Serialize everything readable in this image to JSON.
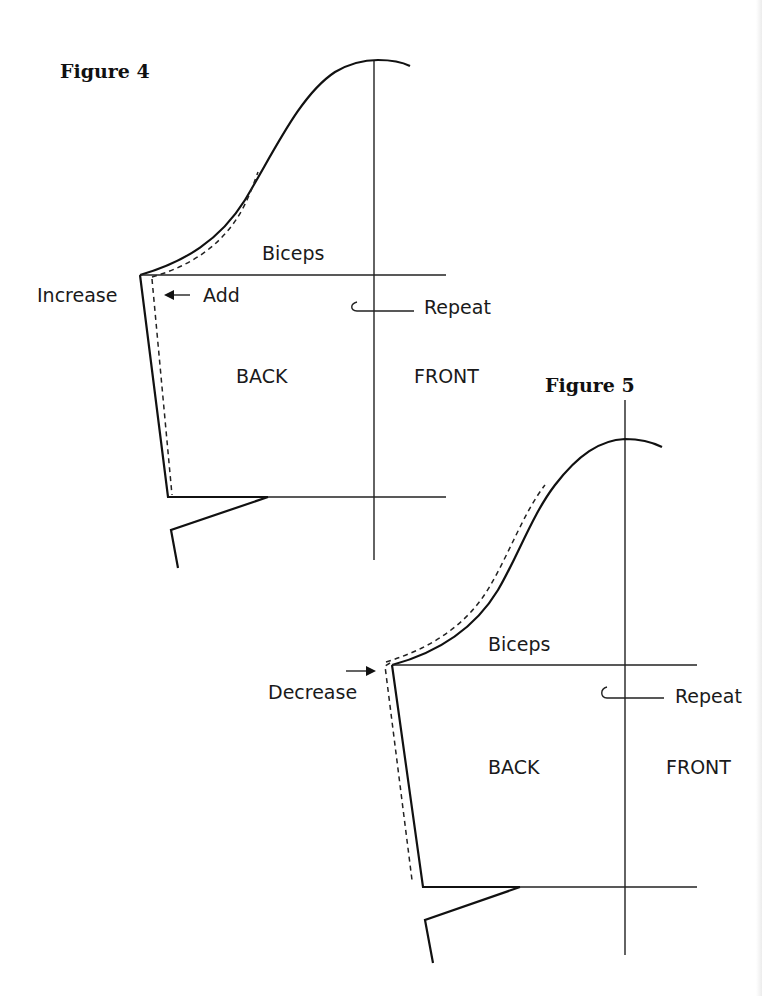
{
  "page": {
    "width": 762,
    "height": 996,
    "background": "#ffffff",
    "ink": "#111111"
  },
  "figures": [
    {
      "id": "figure-4",
      "title": "Figure 4",
      "description": "Sleeve pattern with increased underarm — seam line added outward",
      "labels": {
        "biceps": "Biceps",
        "side_note": "Increase",
        "arrow_note": "Add",
        "repeat": "Repeat",
        "back": "BACK",
        "front": "FRONT"
      },
      "adjustment": "increase"
    },
    {
      "id": "figure-5",
      "title": "Figure 5",
      "description": "Sleeve pattern with decreased underarm — seam line moved inward",
      "labels": {
        "biceps": "Biceps",
        "side_note": "Decrease",
        "repeat": "Repeat",
        "back": "BACK",
        "front": "FRONT"
      },
      "adjustment": "decrease"
    }
  ]
}
